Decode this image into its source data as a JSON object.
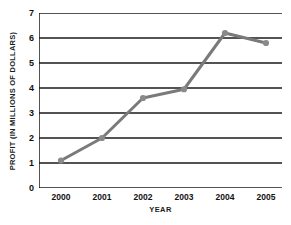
{
  "chart_data": {
    "type": "line",
    "title": "",
    "xlabel": "YEAR",
    "ylabel": "PROFIT (IN MILLIONS OF DOLLARS)",
    "categories": [
      "2000",
      "2001",
      "2002",
      "2003",
      "2004",
      "2005"
    ],
    "values": [
      1.1,
      2.0,
      3.6,
      3.95,
      6.2,
      5.8
    ],
    "series": [
      {
        "name": "Profit",
        "values": [
          1.1,
          2.0,
          3.6,
          3.95,
          6.2,
          5.8
        ]
      }
    ],
    "ylim": [
      0,
      7
    ],
    "yticks": [
      0,
      1,
      2,
      3,
      4,
      5,
      6,
      7
    ],
    "ytick_labels": [
      "0",
      "1",
      "2",
      "3",
      "4",
      "5",
      "6",
      "7"
    ],
    "xtick_labels": [
      "2000",
      "2001",
      "2002",
      "2003",
      "2004",
      "2005"
    ],
    "grid": "horizontal",
    "legend": "none",
    "line_color": "#7a7a7a",
    "marker_color": "#8a8a8a",
    "grid_color": "#1a1a1a",
    "axis_color": "#1a1a1a",
    "background_color": "#ffffff"
  }
}
